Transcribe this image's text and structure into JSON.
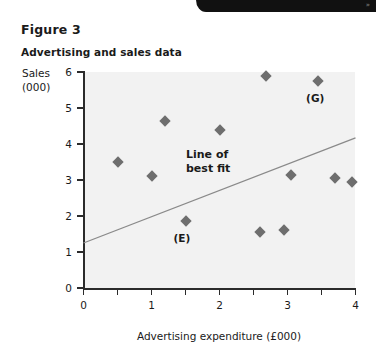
{
  "header_band": {
    "mark": "»"
  },
  "figure": {
    "number": "Figure 3",
    "title": "Advertising and sales data"
  },
  "chart_data": {
    "type": "scatter",
    "title": "Advertising and sales data",
    "xlabel": "Advertising expenditure (£000)",
    "ylabel": "Sales (000)",
    "ylabel_lines": [
      "Sales",
      "(000)"
    ],
    "xlim": [
      0,
      4
    ],
    "ylim": [
      0,
      6
    ],
    "xticks": [
      0,
      1,
      2,
      3,
      4
    ],
    "xtick_labels": [
      "0",
      "1",
      "2",
      "3",
      "4"
    ],
    "xminor_ticks": [
      0.5,
      1.5,
      2.5,
      3.5
    ],
    "yticks": [
      0,
      1,
      2,
      3,
      4,
      5,
      6
    ],
    "ytick_labels": [
      "0",
      "1",
      "2",
      "3",
      "4",
      "5",
      "6"
    ],
    "grid": false,
    "legend": "none",
    "marker_shape": "diamond",
    "marker_color": "#6e6e6e",
    "plot_background": "#f2f2f2",
    "points": [
      {
        "x": 0.5,
        "y": 3.5,
        "label": ""
      },
      {
        "x": 1.0,
        "y": 3.1,
        "label": ""
      },
      {
        "x": 1.2,
        "y": 4.65,
        "label": ""
      },
      {
        "x": 1.5,
        "y": 1.85,
        "label": "E"
      },
      {
        "x": 2.0,
        "y": 4.4,
        "label": ""
      },
      {
        "x": 2.6,
        "y": 1.55,
        "label": ""
      },
      {
        "x": 2.68,
        "y": 5.9,
        "label": ""
      },
      {
        "x": 2.95,
        "y": 1.6,
        "label": ""
      },
      {
        "x": 3.05,
        "y": 3.15,
        "label": ""
      },
      {
        "x": 3.45,
        "y": 5.75,
        "label": "G"
      },
      {
        "x": 3.7,
        "y": 3.05,
        "label": ""
      },
      {
        "x": 3.95,
        "y": 2.95,
        "label": ""
      }
    ],
    "annotations": [
      {
        "name": "point-label-E",
        "text": "(E)",
        "x": 1.5,
        "y": 1.35
      },
      {
        "name": "point-label-G",
        "text": "(G)",
        "x": 3.45,
        "y": 5.25
      }
    ],
    "trendline": {
      "label": "Line of best fit",
      "label_lines": [
        "Line of",
        "best fit"
      ],
      "x0": 0,
      "y0": 1.25,
      "x1": 4,
      "y1": 4.17,
      "color": "#8a8a8a"
    }
  }
}
